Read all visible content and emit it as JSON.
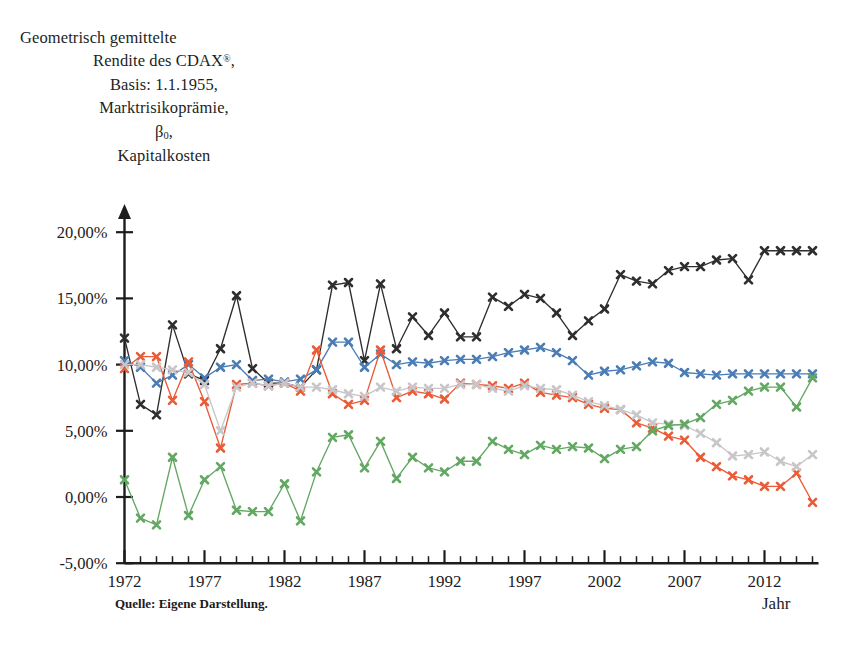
{
  "title": {
    "line1": "Geometrisch gemittelte",
    "line2_pre": "Rendite des CDAX",
    "line2_sup": "®",
    "line2_post": ",",
    "line3": "Basis: 1.1.1955,",
    "line4": "Marktrisikoprämie,",
    "line5_beta": "β",
    "line5_sub": "0",
    "line5_post": ",",
    "line6": "Kapitalkosten"
  },
  "source_note": "Quelle: Eigene Darstellung.",
  "xaxis_title": "Jahr",
  "colors": {
    "black": "#2f2d2e",
    "blue": "#4a7cb5",
    "red": "#ea5b36",
    "green": "#62a862",
    "grey": "#c9c6c9",
    "axis": "#1d1b1b",
    "background": "#ffffff"
  },
  "chart_data": {
    "type": "line",
    "title": "Geometrisch gemittelte Rendite des CDAX®, Basis: 1.1.1955, Marktrisikoprämie, β0, Kapitalkosten",
    "xlabel": "Jahr",
    "ylabel": "",
    "xlim": [
      1971.2,
      2015.6
    ],
    "ylim": [
      -5,
      21.5
    ],
    "grid": false,
    "legend": "none",
    "y_tick_labels": [
      "20,00%",
      "15,00%",
      "10,00%",
      "5,00%",
      "0,00%",
      "-5,00%"
    ],
    "y_tick_values": [
      20,
      15,
      10,
      5,
      0,
      -5
    ],
    "x_tick_labels": [
      "1972",
      "1977",
      "1982",
      "1987",
      "1992",
      "1997",
      "2002",
      "2007",
      "2012"
    ],
    "x_tick_values": [
      1972,
      1977,
      1982,
      1987,
      1992,
      1997,
      2002,
      2007,
      2012
    ],
    "x_minor_step": 1,
    "x": [
      1972,
      1973,
      1974,
      1975,
      1976,
      1977,
      1978,
      1979,
      1980,
      1981,
      1982,
      1983,
      1984,
      1985,
      1986,
      1987,
      1988,
      1989,
      1990,
      1991,
      1992,
      1993,
      1994,
      1995,
      1996,
      1997,
      1998,
      1999,
      2000,
      2001,
      2002,
      2003,
      2004,
      2005,
      2006,
      2007,
      2008,
      2009,
      2010,
      2011,
      2012,
      2013,
      2014,
      2015
    ],
    "series": [
      {
        "name": "Kapitalkosten",
        "color": "#2f2d2e",
        "marker": "x",
        "values": [
          12.0,
          7.0,
          6.2,
          13.0,
          9.3,
          8.8,
          11.2,
          15.2,
          9.7,
          8.6,
          8.6,
          8.3,
          9.6,
          16.0,
          16.2,
          10.3,
          16.1,
          11.2,
          13.6,
          12.2,
          13.9,
          12.1,
          12.1,
          15.1,
          14.4,
          15.3,
          15.0,
          13.9,
          12.2,
          13.3,
          14.2,
          16.8,
          16.3,
          16.1,
          17.1,
          17.4,
          17.4,
          17.9,
          18.0,
          16.4,
          18.6,
          18.6,
          18.6,
          18.6
        ]
      },
      {
        "name": "Geometrisch gemittelte Rendite des CDAX®",
        "color": "#4a7cb5",
        "marker": "x",
        "values": [
          10.3,
          9.8,
          8.6,
          9.2,
          10.0,
          9.0,
          9.8,
          10.0,
          8.8,
          8.9,
          8.7,
          8.9,
          9.6,
          11.7,
          11.7,
          9.8,
          10.8,
          10.0,
          10.2,
          10.1,
          10.3,
          10.4,
          10.4,
          10.6,
          10.9,
          11.1,
          11.3,
          10.9,
          10.3,
          9.2,
          9.5,
          9.6,
          9.9,
          10.2,
          10.1,
          9.4,
          9.3,
          9.2,
          9.3,
          9.3,
          9.3,
          9.3,
          9.3,
          9.3
        ]
      },
      {
        "name": "Marktrisikoprämie",
        "color": "#ea5b36",
        "marker": "x",
        "values": [
          9.7,
          10.6,
          10.6,
          7.3,
          10.2,
          7.2,
          3.7,
          8.5,
          8.6,
          8.4,
          8.6,
          8.0,
          11.1,
          7.8,
          7.0,
          7.3,
          11.1,
          7.5,
          8.0,
          7.8,
          7.4,
          8.6,
          8.5,
          8.4,
          8.2,
          8.6,
          7.9,
          7.7,
          7.5,
          7.0,
          6.7,
          6.6,
          5.6,
          5.2,
          4.6,
          4.3,
          3.0,
          2.3,
          1.6,
          1.3,
          0.8,
          0.8,
          1.8,
          -0.4
        ]
      },
      {
        "name": "Beta-0-Reihe (grau)",
        "color": "#c9c6c9",
        "marker": "x",
        "values": [
          10.0,
          10.0,
          9.8,
          9.6,
          9.4,
          8.5,
          5.0,
          8.3,
          8.6,
          8.4,
          8.6,
          8.3,
          8.3,
          8.1,
          7.8,
          7.6,
          8.3,
          8.0,
          8.3,
          8.2,
          8.2,
          8.5,
          8.5,
          8.2,
          8.0,
          8.4,
          8.2,
          8.1,
          7.7,
          7.2,
          6.9,
          6.6,
          6.2,
          5.6,
          5.5,
          5.4,
          4.8,
          4.1,
          3.1,
          3.2,
          3.4,
          2.7,
          2.3,
          3.2
        ]
      },
      {
        "name": "Grüne Reihe",
        "color": "#62a862",
        "marker": "x",
        "values": [
          1.3,
          -1.6,
          -2.1,
          3.0,
          -1.4,
          1.3,
          2.3,
          -1.0,
          -1.1,
          -1.1,
          1.0,
          -1.8,
          1.9,
          4.5,
          4.7,
          2.2,
          4.2,
          1.4,
          3.0,
          2.2,
          1.9,
          2.7,
          2.7,
          4.2,
          3.6,
          3.2,
          3.9,
          3.6,
          3.8,
          3.7,
          2.9,
          3.6,
          3.8,
          5.0,
          5.4,
          5.5,
          6.0,
          7.0,
          7.3,
          8.0,
          8.3,
          8.3,
          6.8,
          9.0
        ]
      }
    ]
  }
}
